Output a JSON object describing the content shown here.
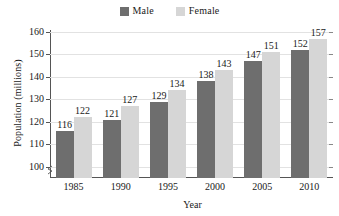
{
  "chart_data": {
    "type": "bar",
    "title": "",
    "xlabel": "Year",
    "ylabel": "Population (millions)",
    "categories": [
      "1985",
      "1990",
      "1995",
      "2000",
      "2005",
      "2010"
    ],
    "series": [
      {
        "name": "Male",
        "color": "#6e6e6e",
        "values": [
          116,
          121,
          129,
          138,
          147,
          152
        ]
      },
      {
        "name": "Female",
        "color": "#d6d6d6",
        "values": [
          122,
          127,
          134,
          143,
          151,
          157
        ]
      }
    ],
    "yticks": [
      100,
      110,
      120,
      130,
      140,
      150,
      160
    ],
    "ylim": [
      95,
      163
    ],
    "ytick_labels": [
      "100",
      "110",
      "120",
      "130",
      "140",
      "150",
      "160"
    ],
    "grid": "horizontal",
    "legend_position": "top-center",
    "axis_break": true,
    "data_labels": true
  },
  "legend": {
    "items": [
      {
        "label": "Male",
        "color": "#6e6e6e"
      },
      {
        "label": "Female",
        "color": "#d6d6d6"
      }
    ]
  }
}
